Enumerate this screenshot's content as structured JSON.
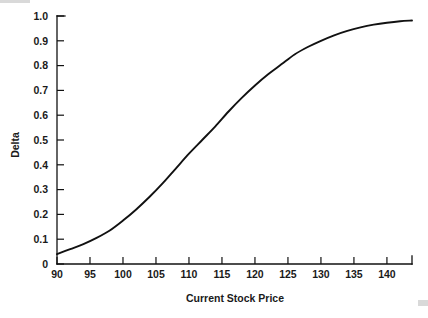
{
  "chart_data": {
    "type": "line",
    "title": "",
    "xlabel": "Current Stock Price",
    "ylabel": "Delta",
    "xlim": [
      90,
      143.8
    ],
    "ylim": [
      0,
      1.0
    ],
    "grid": false,
    "legend": null,
    "xticks": [
      90,
      95,
      100,
      105,
      110,
      115,
      120,
      125,
      130,
      135,
      140
    ],
    "xtick_labels": [
      "90",
      "95",
      "100",
      "105",
      "110",
      "115",
      "120",
      "125",
      "130",
      "135",
      "140"
    ],
    "yticks": [
      0,
      0.1,
      0.2,
      0.3,
      0.4,
      0.5,
      0.6,
      0.7,
      0.8,
      0.9,
      1.0
    ],
    "ytick_labels": [
      "0",
      "0.1",
      "0.2",
      "0.3",
      "0.4",
      "0.5",
      "0.6",
      "0.7",
      "0.8",
      "0.9",
      "1.0"
    ],
    "series": [
      {
        "name": "Delta",
        "color": "#111111",
        "x": [
          90,
          92,
          94,
          96,
          98,
          100,
          102,
          104,
          106,
          108,
          110,
          112,
          114,
          116,
          118,
          120,
          122,
          124,
          126,
          128,
          130,
          132,
          134,
          136,
          138,
          140,
          142,
          143.8
        ],
        "values": [
          0.04,
          0.06,
          0.08,
          0.105,
          0.135,
          0.175,
          0.22,
          0.27,
          0.325,
          0.385,
          0.445,
          0.5,
          0.555,
          0.615,
          0.67,
          0.72,
          0.765,
          0.805,
          0.845,
          0.875,
          0.9,
          0.922,
          0.94,
          0.954,
          0.965,
          0.973,
          0.979,
          0.982
        ]
      }
    ]
  },
  "axes": {
    "y_title": "Delta",
    "x_title": "Current Stock Price"
  }
}
